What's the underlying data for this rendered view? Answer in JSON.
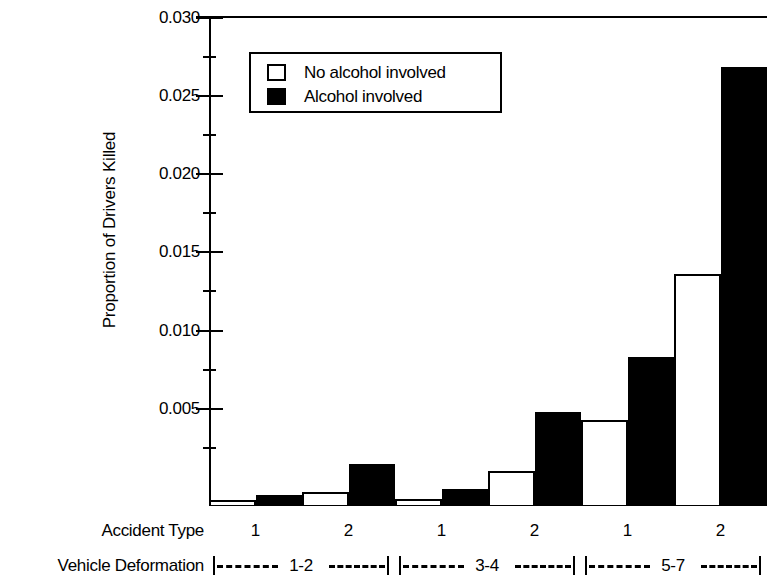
{
  "chart_data": {
    "type": "bar",
    "title": "",
    "xlabel": "Accident Type",
    "ylabel": "Proportion of Drivers Killed",
    "ylim": [
      0,
      0.03
    ],
    "ytick_labels": [
      "0.030",
      "0.025",
      "0.020",
      "0.015",
      "0.010",
      "0.005"
    ],
    "ytick_values": [
      0.03,
      0.025,
      0.02,
      0.015,
      0.01,
      0.005
    ],
    "minor_ticks": true,
    "grid": false,
    "legend_position": "upper-left-inside",
    "categories": [
      "1",
      "2",
      "1",
      "2",
      "1",
      "2"
    ],
    "group_label": "Vehicle Deformation",
    "groups": [
      {
        "label": "1-2",
        "categories": [
          "1",
          "2"
        ]
      },
      {
        "label": "3-4",
        "categories": [
          "1",
          "2"
        ]
      },
      {
        "label": "5-7",
        "categories": [
          "1",
          "2"
        ]
      }
    ],
    "series": [
      {
        "name": "No alcohol involved",
        "color": "#ffffff",
        "values": [
          0.0003,
          0.0008,
          0.0004,
          0.0021,
          0.0052,
          0.0142
        ]
      },
      {
        "name": "Alcohol involved",
        "color": "#000000",
        "values": [
          0.0006,
          0.0025,
          0.001,
          0.0057,
          0.0091,
          0.0269
        ]
      }
    ]
  },
  "legend": {
    "items": [
      {
        "label": "No alcohol involved",
        "swatch": "light"
      },
      {
        "label": "Alcohol involved",
        "swatch": "dark"
      }
    ]
  },
  "axes": {
    "y_title": "Proportion of Drivers Killed",
    "accident_type_label": "Accident Type",
    "vehicle_deformation_label": "Vehicle Deformation",
    "category_ticks": [
      "1",
      "2",
      "1",
      "2",
      "1",
      "2"
    ],
    "deformation_groups": [
      "1-2",
      "3-4",
      "5-7"
    ],
    "ytick_labels": [
      "0.030",
      "0.025",
      "0.020",
      "0.015",
      "0.010",
      "0.005"
    ]
  },
  "colors": {
    "ink": "#000000",
    "paper": "#ffffff",
    "light_series": "#ffffff",
    "dark_series": "#000000"
  }
}
